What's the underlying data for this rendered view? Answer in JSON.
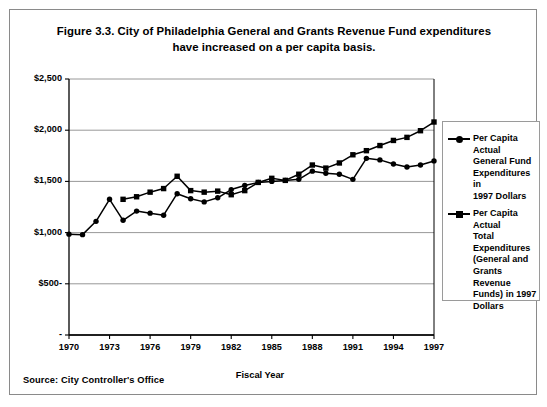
{
  "figure": {
    "title": "Figure 3.3. City of Philadelphia General and Grants Revenue Fund expenditures have increased on a per capita basis.",
    "title_line1": "Figure 3.3. City of Philadelphia General and Grants Revenue Fund expenditures",
    "title_line2": "have increased on a per capita basis.",
    "source": "Source: City Controller's Office"
  },
  "chart_data": {
    "type": "line",
    "title": "Figure 3.3. City of Philadelphia General and Grants Revenue Fund expenditures have increased on a per capita basis.",
    "xlabel": "Fiscal Year",
    "ylabel": "",
    "xlim": [
      1970,
      1997
    ],
    "ylim": [
      0,
      2500
    ],
    "grid": true,
    "grid_axis": "y",
    "legend_position": "right",
    "ytick_labels": [
      "$2,500",
      "$2,000",
      "$1,500",
      "$1,000",
      "$500-",
      "-"
    ],
    "ytick_values": [
      2500,
      2000,
      1500,
      1000,
      500,
      0
    ],
    "xtick_labels": [
      "1970",
      "1973",
      "1976",
      "1979",
      "1982",
      "1985",
      "1988",
      "1991",
      "1994",
      "1997"
    ],
    "xtick_values": [
      1970,
      1973,
      1976,
      1979,
      1982,
      1985,
      1988,
      1991,
      1994,
      1997
    ],
    "x": [
      1970,
      1971,
      1972,
      1973,
      1974,
      1975,
      1976,
      1977,
      1978,
      1979,
      1980,
      1981,
      1982,
      1983,
      1984,
      1985,
      1986,
      1987,
      1988,
      1989,
      1990,
      1991,
      1992,
      1993,
      1994,
      1995,
      1996,
      1997
    ],
    "series": [
      {
        "name": "Per Capita Actual General Fund Expenditures in 1997 Dollars",
        "legend_label_lines": [
          "Per Capita Actual",
          "General Fund",
          "Expenditures in",
          "1997 Dollars"
        ],
        "marker": "circle",
        "color": "#000000",
        "x": [
          1970,
          1971,
          1972,
          1973,
          1974,
          1975,
          1976,
          1977,
          1978,
          1979,
          1980,
          1981,
          1982,
          1983,
          1984,
          1985,
          1986,
          1987,
          1988,
          1989,
          1990,
          1991,
          1992,
          1993,
          1994,
          1995,
          1996,
          1997
        ],
        "values": [
          985,
          980,
          1110,
          1325,
          1120,
          1210,
          1190,
          1170,
          1380,
          1330,
          1300,
          1340,
          1420,
          1460,
          1490,
          1500,
          1510,
          1520,
          1600,
          1580,
          1570,
          1520,
          1725,
          1710,
          1670,
          1640,
          1660,
          1700
        ]
      },
      {
        "name": "Per Capita Actual Total Expenditures (General and Grants Revenue Funds) in 1997 Dollars",
        "legend_label_lines": [
          "Per Capita Actual",
          "Total",
          "Expenditures",
          "(General and",
          "Grants Revenue",
          "Funds) in 1997",
          "Dollars"
        ],
        "marker": "square",
        "color": "#000000",
        "x": [
          1974,
          1975,
          1976,
          1977,
          1978,
          1979,
          1980,
          1981,
          1982,
          1983,
          1984,
          1985,
          1986,
          1987,
          1988,
          1989,
          1990,
          1991,
          1992,
          1993,
          1994,
          1995,
          1996,
          1997
        ],
        "values": [
          1325,
          1350,
          1395,
          1430,
          1550,
          1410,
          1395,
          1405,
          1370,
          1410,
          1490,
          1530,
          1510,
          1570,
          1660,
          1630,
          1680,
          1760,
          1800,
          1850,
          1900,
          1930,
          1995,
          2080
        ]
      }
    ]
  },
  "axis": {
    "x_title": "Fiscal Year"
  }
}
